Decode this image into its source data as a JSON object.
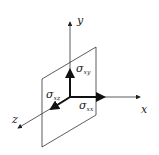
{
  "diagram": {
    "type": "stress-element",
    "axes": {
      "x": "x",
      "y": "y",
      "z": "z"
    },
    "stresses": [
      {
        "symbol": "σ",
        "subscript": "xy",
        "direction": "y"
      },
      {
        "symbol": "σ",
        "subscript": "xx",
        "direction": "x"
      },
      {
        "symbol": "σ",
        "subscript": "xz",
        "direction": "z"
      }
    ],
    "colors": {
      "line": "#333333",
      "background": "#ffffff"
    }
  }
}
